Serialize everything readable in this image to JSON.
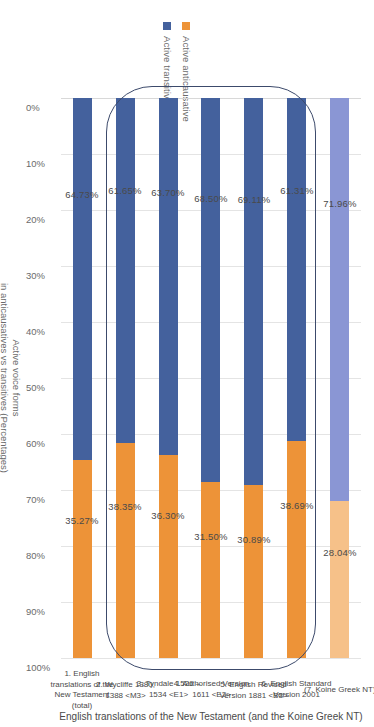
{
  "chart_data": {
    "type": "bar",
    "orientation": "horizontal-stacked",
    "title": "",
    "xlabel": "English translations of the New Testament  (and the Koine Greek NT)",
    "ylabel_line1": "Active voice forms",
    "ylabel_line2": "in anticausatives vs transitives (Percentages)",
    "ylim": [
      0,
      100
    ],
    "tick_labels": [
      "0%",
      "10%",
      "20%",
      "30%",
      "40%",
      "50%",
      "60%",
      "70%",
      "80%",
      "90%",
      "100%"
    ],
    "grid": true,
    "legend_position": "top-right",
    "legend": [
      {
        "name": "Active anticausative",
        "color": "#ed9338"
      },
      {
        "name": "Active transitive",
        "color": "#44619d"
      }
    ],
    "categories": [
      "1. English translations of the New Testament (total)",
      "2. Wycliffe 1380, 1388 <M3>",
      "3. Tyndale 1526 – 1534 <E1>",
      "4. Authorised Version 1611 <E2>",
      "5. English Revised Version 1881 <B3>",
      "6. English Standard Version 2001",
      "(7. Koine Greek NT)"
    ],
    "category_lines": [
      [
        "1. English",
        "translations of the",
        "New Testament",
        "(total)"
      ],
      [
        "2. Wycliffe 1380,",
        "1388 <M3>"
      ],
      [
        "3. Tyndale  1526 –",
        "1534      <E1>"
      ],
      [
        "4. Authorised Version",
        "1611 <E2>"
      ],
      [
        "5. English Revised",
        "Version 1881 <B3>"
      ],
      [
        "6. English Standard",
        "Version 2001"
      ],
      [
        "(7. Koine Greek NT)"
      ]
    ],
    "series": [
      {
        "name": "Active anticausative",
        "color": "#ed9338",
        "values": [
          35.27,
          38.35,
          36.3,
          31.5,
          30.89,
          38.69,
          28.04
        ],
        "labels": [
          "35.27%",
          "38.35%",
          "36.30%",
          "31.50%",
          "30.89%",
          "38.69%",
          "28.04%"
        ]
      },
      {
        "name": "Active transitive",
        "color": "#44619d",
        "values": [
          64.73,
          61.65,
          63.7,
          68.5,
          69.11,
          61.31,
          71.96
        ],
        "labels": [
          "64.73%",
          "61.65%",
          "63.70%",
          "68.50%",
          "69.11%",
          "61.31%",
          "71.96%"
        ]
      }
    ],
    "highlight_colors": {
      "anticausative": "#f6c189",
      "transitive": "#8a96d4"
    },
    "highlight_bar_index": 6,
    "annotation": {
      "shape": "rounded-rectangle",
      "covers_categories": [
        1,
        2,
        3,
        4,
        5
      ],
      "color": "#3c4a6b"
    }
  }
}
